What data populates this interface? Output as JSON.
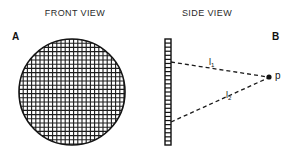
{
  "figure": {
    "panels": {
      "front": {
        "title": "FRONT VIEW",
        "label": "A",
        "element_name": "mesh-disc",
        "geometry": {
          "center_x": 58,
          "center_y": 58,
          "radius": 53,
          "mesh_pitch": 4.2,
          "mesh_line_width": 1.1
        }
      },
      "side": {
        "title": "SIDE VIEW",
        "label": "B",
        "grating": {
          "x": 15,
          "y": 5,
          "width": 6,
          "height": 106,
          "tick_count": 26
        },
        "point": {
          "label": "p",
          "x": 119,
          "y": 43
        },
        "rays": [
          {
            "label": "l",
            "subscript": "1",
            "from_x": 21,
            "from_y": 28,
            "to_x": 118,
            "to_y": 43
          },
          {
            "label": "l",
            "subscript": "2",
            "from_x": 21,
            "from_y": 88,
            "to_x": 118,
            "to_y": 44
          }
        ]
      }
    }
  },
  "colors": {
    "background": "#ffffff",
    "ink": "#111111",
    "title_ink": "#2b2b2b",
    "mesh": "#1c1c1c",
    "dash": "#1a1a1a"
  }
}
